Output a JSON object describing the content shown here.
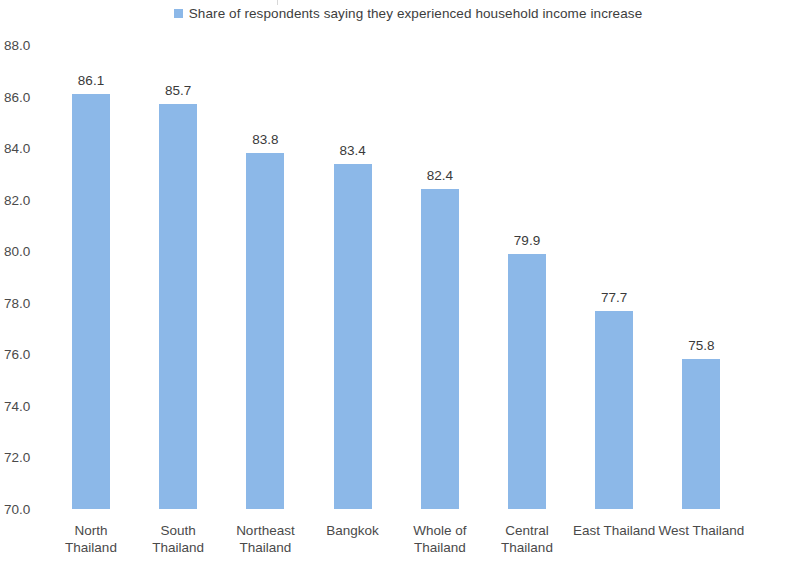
{
  "legend": {
    "entries": [
      {
        "label": "Share of respondents saying they experienced household income increase",
        "color": "#8cb8e8",
        "marker": "square-marker"
      }
    ]
  },
  "axis": {
    "y_ticks": [
      "88.0",
      "86.0",
      "84.0",
      "82.0",
      "80.0",
      "78.0",
      "76.0",
      "74.0",
      "72.0",
      "70.0"
    ]
  },
  "chart_data": {
    "type": "bar",
    "title": "",
    "subtitle": "",
    "xlabel": "",
    "ylabel": "",
    "ylim": [
      70.0,
      88.0
    ],
    "ytick_step": 2.0,
    "grid": false,
    "legend_position": "top-center",
    "bar_color": "#8cb8e8",
    "categories": [
      "North Thailand",
      "South Thailand",
      "Northeast Thailand",
      "Bangkok",
      "Whole of Thailand",
      "Central Thailand",
      "East Thailand",
      "West Thailand"
    ],
    "category_lines": [
      [
        "North",
        "Thailand"
      ],
      [
        "South",
        "Thailand"
      ],
      [
        "Northeast",
        "Thailand"
      ],
      [
        "Bangkok"
      ],
      [
        "Whole of",
        "Thailand"
      ],
      [
        "Central",
        "Thailand"
      ],
      [
        "East Thailand"
      ],
      [
        "West Thailand"
      ]
    ],
    "values": [
      86.1,
      85.7,
      83.8,
      83.4,
      82.4,
      79.9,
      77.7,
      75.8
    ],
    "value_labels": [
      "86.1",
      "85.7",
      "83.8",
      "83.4",
      "82.4",
      "79.9",
      "77.7",
      "75.8"
    ],
    "series": [
      {
        "name": "Share of respondents saying they experienced household income increase",
        "values": [
          86.1,
          85.7,
          83.8,
          83.4,
          82.4,
          79.9,
          77.7,
          75.8
        ]
      }
    ]
  }
}
